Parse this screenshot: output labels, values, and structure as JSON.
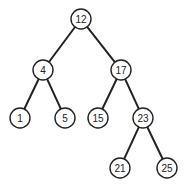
{
  "diagram": {
    "type": "binary-search-tree",
    "node_radius": 10,
    "colors": {
      "stroke": "#222222",
      "fill": "#ffffff",
      "text": "#222222"
    },
    "nodes": [
      {
        "id": "n12",
        "label": "12",
        "x": 81,
        "y": 19
      },
      {
        "id": "n4",
        "label": "4",
        "x": 43,
        "y": 70
      },
      {
        "id": "n17",
        "label": "17",
        "x": 121,
        "y": 70
      },
      {
        "id": "n1",
        "label": "1",
        "x": 20,
        "y": 118
      },
      {
        "id": "n5",
        "label": "5",
        "x": 65,
        "y": 118
      },
      {
        "id": "n15",
        "label": "15",
        "x": 98,
        "y": 118
      },
      {
        "id": "n23",
        "label": "23",
        "x": 143,
        "y": 118
      },
      {
        "id": "n21",
        "label": "21",
        "x": 120,
        "y": 168
      },
      {
        "id": "n25",
        "label": "25",
        "x": 167,
        "y": 168
      }
    ],
    "edges": [
      {
        "from": "n12",
        "to": "n4"
      },
      {
        "from": "n12",
        "to": "n17"
      },
      {
        "from": "n4",
        "to": "n1"
      },
      {
        "from": "n4",
        "to": "n5"
      },
      {
        "from": "n17",
        "to": "n15"
      },
      {
        "from": "n17",
        "to": "n23"
      },
      {
        "from": "n23",
        "to": "n21"
      },
      {
        "from": "n23",
        "to": "n25"
      }
    ]
  }
}
